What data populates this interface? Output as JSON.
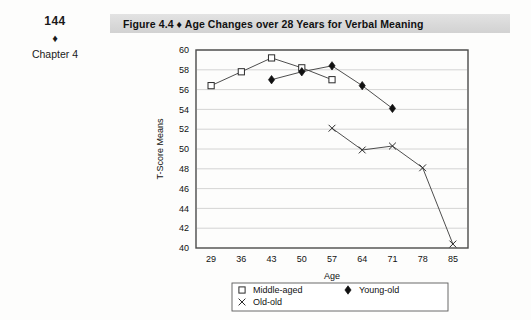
{
  "page": {
    "folio": "144",
    "margin_diamond": "♦",
    "chapter_label": "Chapter 4"
  },
  "figure": {
    "title": "Figure 4.4  ♦  Age Changes over 28 Years for Verbal Meaning",
    "banner_color": "#d9d9d9"
  },
  "chart_data": {
    "type": "line",
    "title": "Age Changes over 28 Years for Verbal Meaning",
    "xlabel": "Age",
    "ylabel": "T-Score Means",
    "x": [
      29,
      36,
      43,
      50,
      57,
      64,
      71,
      78,
      85
    ],
    "xticklabels": [
      "29",
      "36",
      "43",
      "50",
      "57",
      "64",
      "71",
      "78",
      "85"
    ],
    "yticklabels": [
      "40",
      "42",
      "44",
      "46",
      "48",
      "50",
      "52",
      "54",
      "56",
      "58",
      "60"
    ],
    "yticks": [
      40,
      42,
      44,
      46,
      48,
      50,
      52,
      54,
      56,
      58,
      60
    ],
    "xlim": [
      25.5,
      88.5
    ],
    "ylim": [
      40,
      60
    ],
    "grid": "horizontal",
    "legend_position": "bottom",
    "series": [
      {
        "name": "Middle-aged",
        "marker": "open-square",
        "points": [
          {
            "x": 29,
            "y": 56.4
          },
          {
            "x": 36,
            "y": 57.8
          },
          {
            "x": 43,
            "y": 59.2
          },
          {
            "x": 50,
            "y": 58.2
          },
          {
            "x": 57,
            "y": 57.0
          }
        ]
      },
      {
        "name": "Young-old",
        "marker": "filled-diamond",
        "points": [
          {
            "x": 43,
            "y": 57.0
          },
          {
            "x": 50,
            "y": 57.8
          },
          {
            "x": 57,
            "y": 58.4
          },
          {
            "x": 64,
            "y": 56.4
          },
          {
            "x": 71,
            "y": 54.1
          }
        ]
      },
      {
        "name": "Old-old",
        "marker": "cross-x",
        "points": [
          {
            "x": 57,
            "y": 52.1
          },
          {
            "x": 64,
            "y": 49.9
          },
          {
            "x": 71,
            "y": 50.3
          },
          {
            "x": 78,
            "y": 48.1
          },
          {
            "x": 85,
            "y": 40.4
          }
        ]
      }
    ],
    "legend": [
      {
        "label": "Middle-aged",
        "marker": "open-square"
      },
      {
        "label": "Young-old",
        "marker": "filled-diamond"
      },
      {
        "label": "Old-old",
        "marker": "cross-x"
      }
    ]
  }
}
